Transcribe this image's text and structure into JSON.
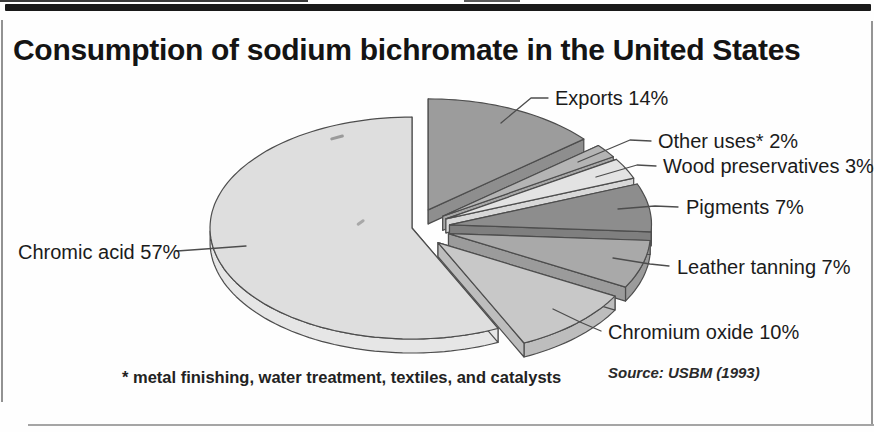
{
  "title": {
    "text": "Consumption of sodium bichromate in the United States"
  },
  "footnote": {
    "text": "* metal finishing, water treatment, textiles, and catalysts"
  },
  "source": {
    "text": "Source: USBM (1993)"
  },
  "chart_data": {
    "type": "pie",
    "style": "3d-exploded",
    "title": "Consumption of sodium bichromate in the United States",
    "unit": "%",
    "start_angle_deg": -90,
    "direction": "clockwise",
    "legend_position": "callout-labels",
    "slices": [
      {
        "label": "Exports",
        "value": 14,
        "color": "#9c9c9c",
        "side": "#8e8e8e",
        "exploded": true
      },
      {
        "label": "Other uses*",
        "value": 2,
        "color": "#b4b4b4",
        "side": "#a7a7a7",
        "exploded": true
      },
      {
        "label": "Wood preservatives",
        "value": 3,
        "color": "#e3e3e3",
        "side": "#d8d8d8",
        "exploded": true
      },
      {
        "label": "Pigments",
        "value": 7,
        "color": "#8d8d8d",
        "side": "#7f7f7f",
        "exploded": true
      },
      {
        "label": "Leather tanning",
        "value": 7,
        "color": "#a9a9a9",
        "side": "#9b9b9b",
        "exploded": true
      },
      {
        "label": "Chromium oxide",
        "value": 10,
        "color": "#c8c8c8",
        "side": "#bdbdbd",
        "exploded": true
      },
      {
        "label": "Chromic acid",
        "value": 57,
        "color": "#dedede",
        "side": "#e6e6e6",
        "exploded": false
      }
    ],
    "geometry": {
      "cx": 412,
      "cy": 228,
      "rx": 202,
      "ry": 111,
      "depth": 14,
      "explode_x": 38,
      "explode_y": 20
    },
    "stroke_color": "#4d4d4d",
    "callouts": [
      {
        "text": "Exports 14%",
        "x": 555,
        "y": 98,
        "anchor": "start",
        "leader": [
          [
            548,
            98
          ],
          [
            531,
            98
          ],
          [
            501,
            123
          ]
        ]
      },
      {
        "text": "Other uses* 2%",
        "x": 658,
        "y": 141,
        "anchor": "start",
        "leader": [
          [
            651,
            141
          ],
          [
            630,
            140
          ],
          [
            578,
            162
          ]
        ]
      },
      {
        "text": "Wood preservatives 3%",
        "x": 663,
        "y": 166,
        "anchor": "start",
        "leader": [
          [
            656,
            166
          ],
          [
            637,
            165
          ],
          [
            596,
            177
          ]
        ]
      },
      {
        "text": "Pigments 7%",
        "x": 686,
        "y": 207,
        "anchor": "start",
        "leader": [
          [
            678,
            207
          ],
          [
            655,
            206
          ],
          [
            618,
            209
          ]
        ]
      },
      {
        "text": "Leather tanning 7%",
        "x": 677,
        "y": 267,
        "anchor": "start",
        "leader": [
          [
            669,
            266
          ],
          [
            650,
            264
          ],
          [
            613,
            258
          ]
        ]
      },
      {
        "text": "Chromium oxide 10%",
        "x": 608,
        "y": 332,
        "anchor": "start",
        "leader": [
          [
            601,
            331
          ],
          [
            580,
            322
          ],
          [
            553,
            309
          ]
        ]
      },
      {
        "text": "Chromic acid 57%",
        "x": 18,
        "y": 252,
        "anchor": "start",
        "leader": [
          [
            177,
            251
          ],
          [
            205,
            249
          ],
          [
            246,
            246
          ]
        ]
      }
    ]
  }
}
